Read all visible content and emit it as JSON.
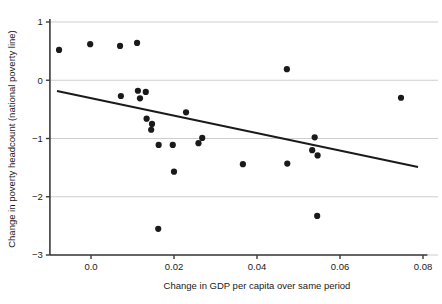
{
  "chart_data": {
    "type": "scatter",
    "title": "",
    "xlabel": "Change in GDP per capita over same period",
    "ylabel": "Change in poverty headcount (national poverty line)",
    "xlim": [
      -0.0099,
      0.0801
    ],
    "ylim": [
      -3,
      1
    ],
    "xticks": [
      0.0,
      0.02,
      0.04,
      0.06,
      0.08
    ],
    "xticklabels": [
      "0.0",
      "0.02",
      "0.04",
      "0.06",
      "0.08"
    ],
    "yticks": [
      1,
      0,
      -1,
      -2,
      -3
    ],
    "yticklabels": [
      "1",
      "0",
      "-1",
      "-2",
      "-3"
    ],
    "grid": "horizontal",
    "legend": "none",
    "marker_color": "#1a1a1a",
    "grid_color": "#c8c8c8",
    "axis_color": "#3a3a3a",
    "trendline_color": "#1a1a1a",
    "points": [
      {
        "x": -0.0077,
        "y": 0.52
      },
      {
        "x": -0.0002,
        "y": 0.62
      },
      {
        "x": 0.007,
        "y": 0.59
      },
      {
        "x": 0.0111,
        "y": 0.64
      },
      {
        "x": 0.0072,
        "y": -0.27
      },
      {
        "x": 0.0113,
        "y": -0.18
      },
      {
        "x": 0.0118,
        "y": -0.31
      },
      {
        "x": 0.0132,
        "y": -0.2
      },
      {
        "x": 0.0134,
        "y": -0.66
      },
      {
        "x": 0.0147,
        "y": -0.75
      },
      {
        "x": 0.0145,
        "y": -0.85
      },
      {
        "x": 0.0163,
        "y": -1.11
      },
      {
        "x": 0.0162,
        "y": -2.55
      },
      {
        "x": 0.02,
        "y": -1.57
      },
      {
        "x": 0.0197,
        "y": -1.11
      },
      {
        "x": 0.0229,
        "y": -0.55
      },
      {
        "x": 0.0268,
        "y": -0.99
      },
      {
        "x": 0.0259,
        "y": -1.08
      },
      {
        "x": 0.0366,
        "y": -1.44
      },
      {
        "x": 0.0473,
        "y": -1.43
      },
      {
        "x": 0.0472,
        "y": 0.19
      },
      {
        "x": 0.0539,
        "y": -0.98
      },
      {
        "x": 0.0533,
        "y": -1.2
      },
      {
        "x": 0.0546,
        "y": -1.29
      },
      {
        "x": 0.0545,
        "y": -2.33
      },
      {
        "x": 0.0747,
        "y": -0.3
      }
    ],
    "trendline": {
      "x_start": -0.0082,
      "y_start": -0.185,
      "x_end": 0.0788,
      "y_end": -1.49
    }
  }
}
